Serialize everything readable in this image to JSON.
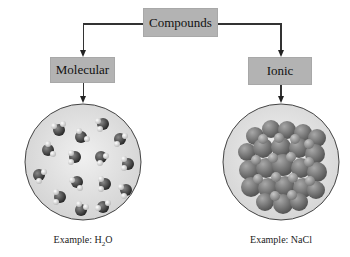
{
  "root": {
    "label": "Compounds"
  },
  "branches": [
    {
      "label": "Molecular",
      "example_prefix": "Example: ",
      "example_formula": {
        "main1": "H",
        "sub": "2",
        "main2": "O"
      }
    },
    {
      "label": "Ionic",
      "example_prefix": "Example: ",
      "example_formula_text": "NaCl"
    }
  ],
  "colors": {
    "box": "#b3b3b3",
    "line": "#333333",
    "circle_bg": "#e2e2e2"
  }
}
